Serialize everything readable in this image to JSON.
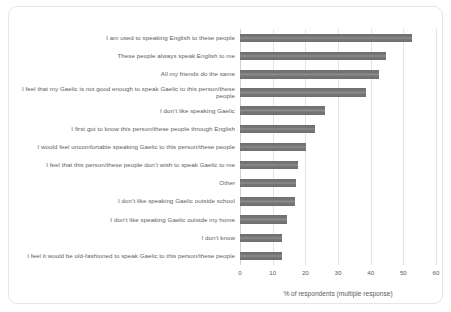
{
  "chart_data": {
    "type": "bar",
    "orientation": "horizontal",
    "title": "",
    "xlabel": "% of respondents (multiple response)",
    "ylabel": "",
    "xlim": [
      0,
      60
    ],
    "xticks": [
      0,
      10,
      20,
      30,
      40,
      50,
      60
    ],
    "grid": true,
    "legend": false,
    "bar_color": "#757575",
    "categories": [
      "I am used to speaking English to these people",
      "These people always speak English to me",
      "All my friends do the same",
      "I feel that my Gaelic is not good enough to speak Gaelic to this person/these people",
      "I don’t like speaking Gaelic",
      "I first got to know this person/these people through English",
      "I would feel uncomfortable speaking Gaelic to this person/these people",
      "I feel that this person/these people don’t wish to speak Gaelic to me",
      "Other",
      "I don’t like speaking Gaelic outside school",
      "I don’t like speaking Gaelic outside my home",
      "I don’t know",
      "I feel it would be old-fashioned to speak Gaelic to this person/these people"
    ],
    "values": [
      52.7,
      44.8,
      42.4,
      38.7,
      26.1,
      23.0,
      20.2,
      17.8,
      17.2,
      16.9,
      14.4,
      12.8,
      12.8
    ]
  }
}
